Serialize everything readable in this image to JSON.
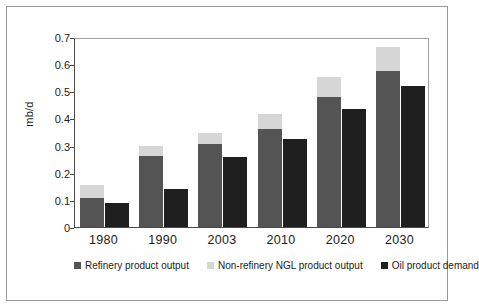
{
  "chart_data": {
    "type": "bar",
    "title": "",
    "subtitle": "",
    "xlabel": "",
    "ylabel": "mb/d",
    "ylim": [
      0,
      0.7
    ],
    "yticks": [
      "0",
      "0.1",
      "0.2",
      "0.3",
      "0.4",
      "0.5",
      "0.6",
      "0.7"
    ],
    "ytick_values": [
      0,
      0.1,
      0.2,
      0.3,
      0.4,
      0.5,
      0.6,
      0.7
    ],
    "grid": false,
    "legend_position": "bottom",
    "stacked_pair": true,
    "categories": [
      "1980",
      "1990",
      "2003",
      "2010",
      "2020",
      "2030"
    ],
    "series": [
      {
        "name": "Refinery product output",
        "color": "#545454",
        "values": [
          0.107,
          0.262,
          0.306,
          0.362,
          0.48,
          0.575
        ]
      },
      {
        "name": "Non-refinery NGL product output",
        "color": "#d6d6d6",
        "values": [
          0.048,
          0.038,
          0.041,
          0.055,
          0.074,
          0.09
        ]
      },
      {
        "name": "Oil product demand",
        "color": "#1f1f1f",
        "values": [
          0.088,
          0.14,
          0.258,
          0.325,
          0.435,
          0.52
        ]
      }
    ],
    "stack_totals": [
      0.155,
      0.3,
      0.347,
      0.417,
      0.554,
      0.665
    ]
  },
  "legend": {
    "items": [
      {
        "label": "Refinery product output",
        "color": "#545454"
      },
      {
        "label": "Non-refinery NGL product output",
        "color": "#d6d6d6"
      },
      {
        "label": "Oil product demand",
        "color": "#1f1f1f"
      }
    ]
  },
  "axes": {
    "y_title": "mb/d"
  }
}
